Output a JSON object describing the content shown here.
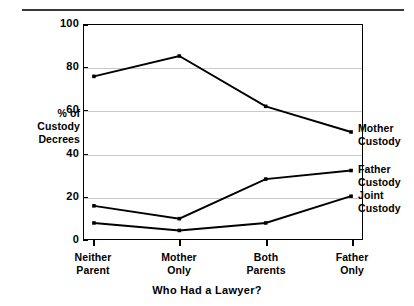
{
  "chart_data": {
    "type": "line",
    "title": "",
    "xlabel": "Who Had a Lawyer?",
    "ylabel": "% of Custody Decrees",
    "categories": [
      "Neither Parent",
      "Mother Only",
      "Both Parents",
      "Father Only"
    ],
    "ylim": [
      0,
      100
    ],
    "yticks": [
      0,
      20,
      40,
      60,
      80,
      100
    ],
    "grid": "horizontal",
    "legend_position": "inline-right",
    "series": [
      {
        "name": "Mother Custody",
        "values": [
          76,
          85.5,
          62,
          50
        ]
      },
      {
        "name": "Father Custody",
        "values": [
          15.5,
          9.5,
          28,
          32
        ]
      },
      {
        "name": "Joint Custody",
        "values": [
          7.5,
          4,
          7.5,
          20
        ]
      }
    ]
  },
  "axis": {
    "y_title_lines": [
      "% of",
      "Custody",
      "Decrees"
    ],
    "y_tick_labels": [
      "100",
      "80",
      "60",
      "40",
      "20",
      "0"
    ],
    "x_tick_labels": [
      {
        "line1": "Neither",
        "line2": "Parent"
      },
      {
        "line1": "Mother",
        "line2": "Only"
      },
      {
        "line1": "Both",
        "line2": "Parents"
      },
      {
        "line1": "Father",
        "line2": "Only"
      }
    ],
    "x_title": "Who Had a Lawyer?"
  },
  "series_labels": [
    {
      "line1": "Mother",
      "line2": "Custody"
    },
    {
      "line1": "Father",
      "line2": "Custody"
    },
    {
      "line1": "Joint",
      "line2": "Custody"
    }
  ],
  "colors": {
    "line": "#000000",
    "grid": "#c9c9c9",
    "axis": "#000000",
    "background": "#ffffff"
  }
}
